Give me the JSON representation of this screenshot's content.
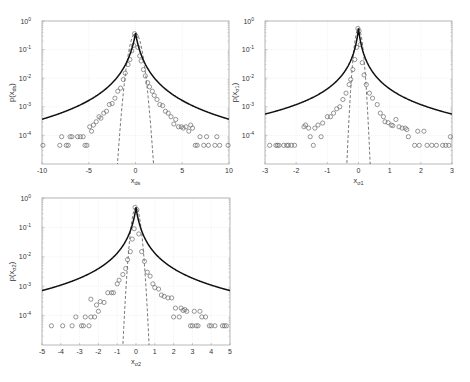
{
  "chart_data": [
    {
      "type": "scatter",
      "id": "ds",
      "title": "",
      "xlabel": "x_ds",
      "xlabel_main": "x",
      "xlabel_sub": "ds",
      "ylabel": "p(x_ds)",
      "ylabel_main": "p(x",
      "ylabel_sub": "ds",
      "ylabel_close": ")",
      "xlim": [
        -10,
        10
      ],
      "ylim": [
        1e-05,
        1
      ],
      "yscale": "log",
      "xticks": [
        -10,
        -5,
        0,
        5,
        10
      ],
      "xtick_labels": [
        "-10",
        "-5",
        "0",
        "5",
        "10"
      ],
      "yticks": [
        1,
        0.1,
        0.01,
        0.001,
        0.0001
      ],
      "ytick_labels": [
        [
          "10",
          "0"
        ],
        [
          "10",
          "-1"
        ],
        [
          "10",
          "-2"
        ],
        [
          "10",
          "-3"
        ],
        [
          "10",
          "-4"
        ]
      ],
      "grid": true,
      "box": [
        42,
        21,
        229,
        164
      ],
      "fit_heavy": {
        "peak": 0.38,
        "scale": 0.55,
        "power": 2.35
      },
      "fit_gauss": {
        "peak": 0.38,
        "sigma": 0.42
      },
      "series": [
        {
          "name": "empirical",
          "marker": "circle",
          "points": [
            [
              -9.9,
              4.5e-05
            ],
            [
              -8.1,
              4.5e-05
            ],
            [
              -7.9,
              9e-05
            ],
            [
              -7.4,
              4.5e-05
            ],
            [
              -7.2,
              4.5e-05
            ],
            [
              -7.0,
              9e-05
            ],
            [
              -6.8,
              9e-05
            ],
            [
              -6.2,
              9e-05
            ],
            [
              -5.9,
              9e-05
            ],
            [
              -5.6,
              9e-05
            ],
            [
              -5.4,
              4.5e-05
            ],
            [
              -5.2,
              4.5e-05
            ],
            [
              -4.9,
              0.0002
            ],
            [
              -4.7,
              0.00014
            ],
            [
              -4.5,
              0.00023
            ],
            [
              -4.2,
              0.0003
            ],
            [
              -3.9,
              0.00045
            ],
            [
              -3.7,
              0.0004
            ],
            [
              -3.4,
              0.0006
            ],
            [
              -3.1,
              0.0007
            ],
            [
              -2.8,
              0.0012
            ],
            [
              -2.5,
              0.0013
            ],
            [
              -2.2,
              0.002
            ],
            [
              -1.9,
              0.0035
            ],
            [
              -1.6,
              0.0045
            ],
            [
              -1.3,
              0.009
            ],
            [
              -1.1,
              0.015
            ],
            [
              -0.8,
              0.03
            ],
            [
              -0.6,
              0.045
            ],
            [
              -0.4,
              0.09
            ],
            [
              -0.2,
              0.14
            ],
            [
              -0.1,
              0.36
            ],
            [
              0.05,
              0.3
            ],
            [
              0.25,
              0.12
            ],
            [
              0.45,
              0.06
            ],
            [
              0.6,
              0.04
            ],
            [
              0.85,
              0.02
            ],
            [
              1.05,
              0.012
            ],
            [
              1.3,
              0.007
            ],
            [
              1.5,
              0.005
            ],
            [
              1.8,
              0.0035
            ],
            [
              2.0,
              0.0025
            ],
            [
              2.3,
              0.0018
            ],
            [
              2.6,
              0.0012
            ],
            [
              2.9,
              0.0011
            ],
            [
              3.2,
              0.0007
            ],
            [
              3.5,
              0.0006
            ],
            [
              3.8,
              0.00045
            ],
            [
              4.1,
              0.00025
            ],
            [
              4.3,
              0.00036
            ],
            [
              4.6,
              0.0002
            ],
            [
              4.9,
              0.0002
            ],
            [
              5.1,
              0.00018
            ],
            [
              5.4,
              0.0002
            ],
            [
              5.7,
              0.00014
            ],
            [
              5.9,
              0.00023
            ],
            [
              6.1,
              0.00018
            ],
            [
              6.4,
              4.5e-05
            ],
            [
              6.6,
              4.5e-05
            ],
            [
              6.9,
              9e-05
            ],
            [
              7.3,
              4.5e-05
            ],
            [
              7.6,
              9e-05
            ],
            [
              7.8,
              4.5e-05
            ],
            [
              8.5,
              4.5e-05
            ],
            [
              8.7,
              9e-05
            ],
            [
              9.0,
              4.5e-05
            ],
            [
              9.9,
              4.5e-05
            ]
          ]
        },
        {
          "name": "heavy-tailed fit",
          "style": "solid"
        },
        {
          "name": "gaussian fit",
          "style": "dashed"
        }
      ]
    },
    {
      "type": "scatter",
      "id": "sigma1",
      "title": "",
      "xlabel": "x_σ1",
      "xlabel_main": "x",
      "xlabel_sub": "σ1",
      "ylabel": "p(x_σ1)",
      "ylabel_main": "p(x",
      "ylabel_sub": "σ1",
      "ylabel_close": ")",
      "xlim": [
        -3,
        3
      ],
      "ylim": [
        1e-05,
        1
      ],
      "yscale": "log",
      "xticks": [
        -3,
        -2,
        -1,
        0,
        1,
        2,
        3
      ],
      "xtick_labels": [
        "-3",
        "-2",
        "-1",
        "0",
        "1",
        "2",
        "3"
      ],
      "yticks": [
        1,
        0.1,
        0.01,
        0.001,
        0.0001
      ],
      "ytick_labels": [
        [
          "10",
          "0"
        ],
        [
          "10",
          "-1"
        ],
        [
          "10",
          "-2"
        ],
        [
          "10",
          "-3"
        ],
        [
          "10",
          "-4"
        ]
      ],
      "grid": true,
      "box": [
        265,
        21,
        452,
        164
      ],
      "fit_heavy": {
        "peak": 0.55,
        "scale": 0.09,
        "power": 1.95
      },
      "fit_gauss": {
        "peak": 0.55,
        "sigma": 0.08
      },
      "series": [
        {
          "name": "empirical",
          "marker": "circle",
          "points": [
            [
              -2.85,
              4.5e-05
            ],
            [
              -2.65,
              4.5e-05
            ],
            [
              -2.6,
              4.5e-05
            ],
            [
              -2.55,
              4.5e-05
            ],
            [
              -2.4,
              4.5e-05
            ],
            [
              -2.3,
              4.5e-05
            ],
            [
              -2.25,
              4.5e-05
            ],
            [
              -2.15,
              4.5e-05
            ],
            [
              -2.05,
              4.5e-05
            ],
            [
              -1.75,
              0.0002
            ],
            [
              -1.7,
              0.00023
            ],
            [
              -1.6,
              0.00018
            ],
            [
              -1.55,
              9e-05
            ],
            [
              -1.45,
              4.5e-05
            ],
            [
              -1.4,
              0.00018
            ],
            [
              -1.3,
              0.00023
            ],
            [
              -1.2,
              9e-05
            ],
            [
              -1.15,
              0.00027
            ],
            [
              -1.0,
              0.00045
            ],
            [
              -0.9,
              0.00045
            ],
            [
              -0.8,
              0.0006
            ],
            [
              -0.7,
              0.00085
            ],
            [
              -0.6,
              0.001
            ],
            [
              -0.5,
              0.0018
            ],
            [
              -0.4,
              0.003
            ],
            [
              -0.3,
              0.006
            ],
            [
              -0.25,
              0.009
            ],
            [
              -0.18,
              0.02
            ],
            [
              -0.12,
              0.045
            ],
            [
              -0.06,
              0.12
            ],
            [
              -0.02,
              0.55
            ],
            [
              0.02,
              0.45
            ],
            [
              0.06,
              0.15
            ],
            [
              0.12,
              0.035
            ],
            [
              0.18,
              0.013
            ],
            [
              0.25,
              0.006
            ],
            [
              0.35,
              0.003
            ],
            [
              0.45,
              0.002
            ],
            [
              0.6,
              0.0012
            ],
            [
              0.7,
              0.0006
            ],
            [
              0.8,
              0.00045
            ],
            [
              0.85,
              0.0003
            ],
            [
              0.95,
              0.00028
            ],
            [
              1.05,
              0.00023
            ],
            [
              1.1,
              0.00022
            ],
            [
              1.2,
              0.00036
            ],
            [
              1.3,
              0.0002
            ],
            [
              1.4,
              0.00018
            ],
            [
              1.5,
              0.00018
            ],
            [
              1.55,
              0.00016
            ],
            [
              1.6,
              9e-05
            ],
            [
              1.8,
              4.5e-05
            ],
            [
              1.9,
              0.00014
            ],
            [
              1.95,
              4.5e-05
            ],
            [
              2.1,
              0.00014
            ],
            [
              2.2,
              4.5e-05
            ],
            [
              2.35,
              4.5e-05
            ],
            [
              2.5,
              4.5e-05
            ],
            [
              2.7,
              4.5e-05
            ],
            [
              2.8,
              4.5e-05
            ],
            [
              2.9,
              4.5e-05
            ],
            [
              2.95,
              9e-05
            ]
          ]
        },
        {
          "name": "heavy-tailed fit",
          "style": "solid"
        },
        {
          "name": "gaussian fit",
          "style": "dashed"
        }
      ]
    },
    {
      "type": "scatter",
      "id": "sigma2",
      "title": "",
      "xlabel": "x_σ2",
      "xlabel_main": "x",
      "xlabel_sub": "σ2",
      "ylabel": "p(x_σ2)",
      "ylabel_main": "p(x",
      "ylabel_sub": "σ2",
      "ylabel_close": ")",
      "xlim": [
        -5,
        5
      ],
      "ylim": [
        1e-05,
        1
      ],
      "yscale": "log",
      "xticks": [
        -5,
        -4,
        -3,
        -2,
        -1,
        0,
        1,
        2,
        3,
        4,
        5
      ],
      "xtick_labels": [
        "-5",
        "-4",
        "-3",
        "-2",
        "-1",
        "0",
        "1",
        "2",
        "3",
        "4",
        "5"
      ],
      "yticks": [
        1,
        0.1,
        0.01,
        0.001,
        0.0001
      ],
      "ytick_labels": [
        [
          "10",
          "0"
        ],
        [
          "10",
          "-1"
        ],
        [
          "10",
          "-2"
        ],
        [
          "10",
          "-3"
        ],
        [
          "10",
          "-4"
        ]
      ],
      "grid": true,
      "box": [
        42,
        198,
        230,
        345
      ],
      "fit_heavy": {
        "peak": 0.48,
        "scale": 0.2,
        "power": 2.0
      },
      "fit_gauss": {
        "peak": 0.48,
        "sigma": 0.15
      },
      "series": [
        {
          "name": "empirical",
          "marker": "circle",
          "points": [
            [
              -4.5,
              4.5e-05
            ],
            [
              -3.9,
              4.5e-05
            ],
            [
              -3.4,
              4.5e-05
            ],
            [
              -3.2,
              9e-05
            ],
            [
              -2.9,
              4.5e-05
            ],
            [
              -2.8,
              4.5e-05
            ],
            [
              -2.7,
              9e-05
            ],
            [
              -2.5,
              4.5e-05
            ],
            [
              -2.4,
              9e-05
            ],
            [
              -2.2,
              9e-05
            ],
            [
              -2.4,
              0.00036
            ],
            [
              -2.1,
              0.00023
            ],
            [
              -1.9,
              0.0003
            ],
            [
              -2.0,
              0.00014
            ],
            [
              -1.7,
              0.00028
            ],
            [
              -1.5,
              0.0006
            ],
            [
              -1.3,
              0.0006
            ],
            [
              -1.2,
              0.0006
            ],
            [
              -1.0,
              0.0012
            ],
            [
              -0.9,
              0.0016
            ],
            [
              -0.7,
              0.0025
            ],
            [
              -0.55,
              0.004
            ],
            [
              -0.45,
              0.008
            ],
            [
              -0.3,
              0.015
            ],
            [
              -0.2,
              0.04
            ],
            [
              -0.1,
              0.09
            ],
            [
              -0.05,
              0.48
            ],
            [
              0.05,
              0.4
            ],
            [
              0.15,
              0.06
            ],
            [
              0.3,
              0.015
            ],
            [
              0.45,
              0.007
            ],
            [
              0.6,
              0.003
            ],
            [
              0.75,
              0.0022
            ],
            [
              0.9,
              0.0012
            ],
            [
              1.0,
              0.0009
            ],
            [
              1.2,
              0.0008
            ],
            [
              1.35,
              0.0005
            ],
            [
              1.5,
              0.00045
            ],
            [
              1.7,
              0.0004
            ],
            [
              1.9,
              0.0004
            ],
            [
              2.0,
              9e-05
            ],
            [
              2.1,
              0.00018
            ],
            [
              2.3,
              9e-05
            ],
            [
              2.4,
              0.00018
            ],
            [
              2.5,
              0.00015
            ],
            [
              2.6,
              0.00016
            ],
            [
              2.7,
              0.00014
            ],
            [
              2.9,
              4.5e-05
            ],
            [
              3.0,
              4.5e-05
            ],
            [
              3.1,
              0.00014
            ],
            [
              3.2,
              4.5e-05
            ],
            [
              3.3,
              4.5e-05
            ],
            [
              3.4,
              0.00014
            ],
            [
              3.5,
              9e-05
            ],
            [
              3.7,
              9e-05
            ],
            [
              3.9,
              4.5e-05
            ],
            [
              4.0,
              4.5e-05
            ],
            [
              4.2,
              4.5e-05
            ],
            [
              4.6,
              4.5e-05
            ],
            [
              4.7,
              4.5e-05
            ],
            [
              4.8,
              4.5e-05
            ]
          ]
        },
        {
          "name": "heavy-tailed fit",
          "style": "solid"
        },
        {
          "name": "gaussian fit",
          "style": "dashed"
        }
      ]
    }
  ]
}
